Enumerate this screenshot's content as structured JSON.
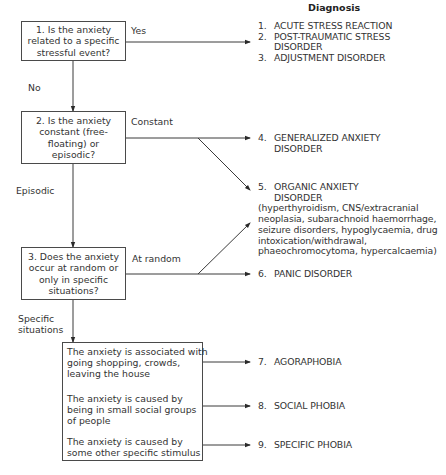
{
  "heading": "Diagnosis",
  "questions": [
    {
      "id": "q1",
      "text": "1. Is the anxiety related to a specific stressful event?"
    },
    {
      "id": "q2",
      "text": "2. Is the anxiety constant (free-floating) or episodic?"
    },
    {
      "id": "q3",
      "text": "3. Does the anxiety occur at random or only in specific situations?"
    }
  ],
  "edge_labels": {
    "yes": "Yes",
    "no": "No",
    "constant": "Constant",
    "episodic": "Episodic",
    "at_random": "At random",
    "specific_line1": "Specific",
    "specific_line2": "situations"
  },
  "situations": [
    {
      "line1": "The anxiety is associated with",
      "line2": "going shopping, crowds,",
      "line3": "leaving the house"
    },
    {
      "line1": "The anxiety is caused by",
      "line2": "being in small social groups",
      "line3": "of people"
    },
    {
      "line1": "The anxiety is caused by",
      "line2": "some other specific stimulus",
      "line3": ""
    }
  ],
  "diagnoses": {
    "group1": [
      {
        "num": "1.",
        "text": "ACUTE STRESS REACTION",
        "cont": ""
      },
      {
        "num": "2.",
        "text": "POST-TRAUMATIC STRESS",
        "cont": "DISORDER"
      },
      {
        "num": "3.",
        "text": "ADJUSTMENT DISORDER",
        "cont": ""
      }
    ],
    "d4": {
      "num": "4.",
      "text": "GENERALIZED ANXIETY",
      "cont": "DISORDER"
    },
    "d5": {
      "num": "5.",
      "text": "ORGANIC ANXIETY",
      "cont": "DISORDER",
      "details": [
        "(hyperthyroidism, CNS/extracranial",
        "neoplasia, subarachnoid haemorrhage,",
        "seizure disorders, hypoglycaemia, drug",
        "intoxication/withdrawal,",
        "phaeochromocytoma, hypercalcaemia)"
      ]
    },
    "d6": {
      "num": "6.",
      "text": "PANIC DISORDER"
    },
    "d7": {
      "num": "7.",
      "text": "AGORAPHOBIA"
    },
    "d8": {
      "num": "8.",
      "text": "SOCIAL PHOBIA"
    },
    "d9": {
      "num": "9.",
      "text": "SPECIFIC PHOBIA"
    }
  },
  "colors": {
    "line": "#3a3a3a",
    "text": "#333333",
    "background": "#ffffff"
  }
}
